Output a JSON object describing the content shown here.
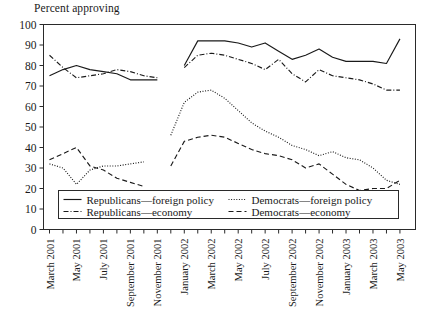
{
  "chart_data": {
    "type": "line",
    "title": "Percent approving",
    "xlabel": "",
    "ylabel": "",
    "ylim": [
      0,
      100
    ],
    "ytick_step": 10,
    "yticks": [
      0,
      10,
      20,
      30,
      40,
      50,
      60,
      70,
      80,
      90,
      100
    ],
    "grid": false,
    "legend_position": "inside-bottom-left",
    "x_tick_labels": [
      "March 2001",
      "May 2001",
      "July 2001",
      "September 2001",
      "November 2001",
      "January 2002",
      "March 2002",
      "May 2002",
      "July 2002",
      "September 2002",
      "November 2002",
      "January 2003",
      "March 2003",
      "May 2003"
    ],
    "x_tick_months_between_labels": 2,
    "x_months": [
      "March 2001",
      "April 2001",
      "May 2001",
      "June 2001",
      "July 2001",
      "August 2001",
      "September 2001",
      "October 2001",
      "November 2001",
      "December 2001",
      "January 2002",
      "February 2002",
      "March 2002",
      "April 2002",
      "May 2002",
      "June 2002",
      "July 2002",
      "August 2002",
      "September 2002",
      "October 2002",
      "November 2002",
      "December 2002",
      "January 2003",
      "February 2003",
      "March 2003",
      "April 2003",
      "May 2003"
    ],
    "series": [
      {
        "name": "Republicans—foreign policy",
        "style": "solid",
        "x_index": [
          0,
          1,
          2,
          3,
          4,
          5,
          6,
          7,
          8,
          9,
          10,
          11,
          12,
          13,
          14,
          15,
          16,
          17,
          18,
          19,
          20,
          21,
          22,
          23,
          24,
          25,
          26
        ],
        "values": [
          75,
          78,
          80,
          78,
          77,
          76,
          73,
          73,
          73,
          null,
          80,
          92,
          92,
          92,
          91,
          89,
          91,
          87,
          83,
          85,
          88,
          84,
          82,
          82,
          82,
          81,
          93
        ]
      },
      {
        "name": "Republicans—economy",
        "style": "dash-dot",
        "x_index": [
          0,
          1,
          2,
          3,
          4,
          5,
          6,
          7,
          8,
          9,
          10,
          11,
          12,
          13,
          14,
          15,
          16,
          17,
          18,
          19,
          20,
          21,
          22,
          23,
          24,
          25,
          26
        ],
        "values": [
          85,
          79,
          74,
          75,
          76,
          78,
          77,
          75,
          74,
          null,
          79,
          85,
          86,
          85,
          83,
          81,
          78,
          83,
          76,
          72,
          78,
          75,
          74,
          73,
          71,
          68,
          68
        ]
      },
      {
        "name": "Democrats—foreign policy",
        "style": "dotted",
        "x_index": [
          0,
          1,
          2,
          3,
          4,
          5,
          6,
          7,
          8,
          9,
          10,
          11,
          12,
          13,
          14,
          15,
          16,
          17,
          18,
          19,
          20,
          21,
          22,
          23,
          24,
          25,
          26
        ],
        "values": [
          32,
          30,
          22,
          29,
          31,
          31,
          32,
          33,
          null,
          46,
          62,
          67,
          68,
          64,
          58,
          52,
          48,
          45,
          41,
          39,
          36,
          38,
          35,
          34,
          30,
          24,
          22
        ]
      },
      {
        "name": "Democrats—economy",
        "style": "dashed",
        "x_index": [
          0,
          1,
          2,
          3,
          4,
          5,
          6,
          7,
          8,
          9,
          10,
          11,
          12,
          13,
          14,
          15,
          16,
          17,
          18,
          19,
          20,
          21,
          22,
          23,
          24,
          25,
          26
        ],
        "values": [
          34,
          37,
          40,
          31,
          29,
          25,
          23,
          21,
          null,
          31,
          43,
          45,
          46,
          45,
          42,
          39,
          37,
          36,
          34,
          30,
          32,
          27,
          22,
          19,
          20,
          20,
          24
        ]
      }
    ]
  },
  "legend": {
    "entries": [
      {
        "label": "Republicans—foreign policy",
        "style": "solid"
      },
      {
        "label": "Democrats—foreign policy",
        "style": "dotted"
      },
      {
        "label": "Republicans—economy",
        "style": "dash-dot"
      },
      {
        "label": "Democrats—economy",
        "style": "dashed"
      }
    ]
  }
}
